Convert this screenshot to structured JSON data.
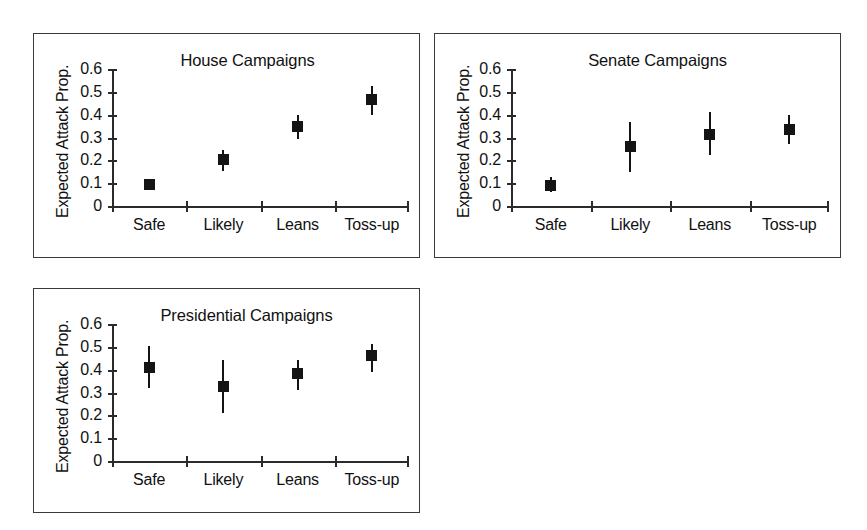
{
  "figure": {
    "background": "#ffffff",
    "ink_color": "#141414",
    "axis_color": "#2b2b2b"
  },
  "panels": [
    {
      "id": "house",
      "title": "House Campaigns",
      "ylabel": "Expected Attack Prop."
    },
    {
      "id": "senate",
      "title": "Senate Campaigns",
      "ylabel": "Expected Attack Prop."
    },
    {
      "id": "presidential",
      "title": "Presidential Campaigns",
      "ylabel": "Expected Attack Prop."
    }
  ],
  "axis": {
    "ytick_labels": [
      "0.6",
      "0.5",
      "0.4",
      "0.3",
      "0.2",
      "0.1",
      "0"
    ],
    "ytick_values": [
      0.6,
      0.5,
      0.4,
      0.3,
      0.2,
      0.1,
      0
    ],
    "xtick_labels": [
      "Safe",
      "Likely",
      "Leans",
      "Toss-up"
    ],
    "ylim": [
      0,
      0.6
    ]
  },
  "chart_data": [
    {
      "type": "scatter",
      "title": "House Campaigns",
      "xlabel": "",
      "ylabel": "Expected Attack Prop.",
      "ylim": [
        0,
        0.6
      ],
      "yticks": [
        0,
        0.1,
        0.2,
        0.3,
        0.4,
        0.5,
        0.6
      ],
      "grid": false,
      "legend": "none",
      "marker": "filled-square-with-error-bars",
      "categories": [
        "Safe",
        "Likely",
        "Leans",
        "Toss-up"
      ],
      "values": [
        0.095,
        0.205,
        0.35,
        0.465
      ],
      "error_low": [
        0.078,
        0.155,
        0.295,
        0.4
      ],
      "error_high": [
        0.115,
        0.245,
        0.4,
        0.525
      ]
    },
    {
      "type": "scatter",
      "title": "Senate Campaigns",
      "xlabel": "",
      "ylabel": "Expected Attack Prop.",
      "ylim": [
        0,
        0.6
      ],
      "yticks": [
        0,
        0.1,
        0.2,
        0.3,
        0.4,
        0.5,
        0.6
      ],
      "grid": false,
      "legend": "none",
      "marker": "filled-square-with-error-bars",
      "categories": [
        "Safe",
        "Likely",
        "Leans",
        "Toss-up"
      ],
      "values": [
        0.09,
        0.26,
        0.315,
        0.335
      ],
      "error_low": [
        0.06,
        0.15,
        0.225,
        0.27
      ],
      "error_high": [
        0.125,
        0.37,
        0.41,
        0.4
      ]
    },
    {
      "type": "scatter",
      "title": "Presidential Campaigns",
      "xlabel": "",
      "ylabel": "Expected Attack Prop.",
      "ylim": [
        0,
        0.6
      ],
      "yticks": [
        0,
        0.1,
        0.2,
        0.3,
        0.4,
        0.5,
        0.6
      ],
      "grid": false,
      "legend": "none",
      "marker": "filled-square-with-error-bars",
      "categories": [
        "Safe",
        "Likely",
        "Leans",
        "Toss-up"
      ],
      "values": [
        0.41,
        0.327,
        0.382,
        0.46
      ],
      "error_low": [
        0.318,
        0.21,
        0.312,
        0.388
      ],
      "error_high": [
        0.502,
        0.443,
        0.443,
        0.513
      ]
    }
  ]
}
